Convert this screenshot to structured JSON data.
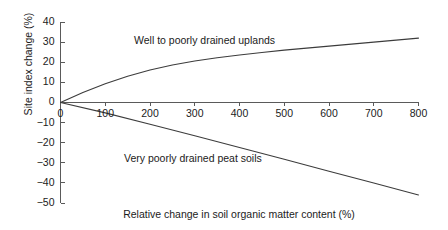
{
  "chart_data": {
    "type": "line",
    "title": "",
    "subtitle": "",
    "xlabel": "Relative change in soil organic matter content (%)",
    "ylabel": "Site index change (%)",
    "xlim": [
      0,
      800
    ],
    "ylim": [
      -50,
      40
    ],
    "xticks": [
      0,
      100,
      200,
      300,
      400,
      500,
      600,
      700,
      800
    ],
    "xticklabels": [
      "0",
      "100",
      "200",
      "300",
      "400",
      "500",
      "600",
      "700",
      "800"
    ],
    "yticks": [
      40,
      30,
      20,
      10,
      0,
      -10,
      -20,
      -30,
      -40,
      -50
    ],
    "yticklabels": [
      "40",
      "30",
      "20",
      "10",
      "0",
      "−10",
      "−20",
      "−30",
      "−40",
      "−50"
    ],
    "grid": false,
    "legend_position": "inline-annotation",
    "axis_color": "#5a5a5a",
    "line_color": "#3c3c3c",
    "background": "#ffffff",
    "series": [
      {
        "name": "Well to poorly drained uplands",
        "annotation": "Well to poorly drained uplands",
        "annotation_x": 330,
        "annotation_y": 30,
        "shape": "concave-increasing",
        "x": [
          0,
          50,
          100,
          150,
          200,
          250,
          300,
          350,
          400,
          450,
          500,
          550,
          600,
          650,
          700,
          750,
          800
        ],
        "y": [
          0,
          5.0,
          9.3,
          13.0,
          16.1,
          18.6,
          20.6,
          22.2,
          23.6,
          24.8,
          26.0,
          27.0,
          28.0,
          29.0,
          30.0,
          31.0,
          32.0
        ]
      },
      {
        "name": "Very poorly drained peat soils",
        "annotation": "Very poorly drained peat soils",
        "annotation_x": 270,
        "annotation_y": -29,
        "shape": "near-linear-decreasing",
        "x": [
          0,
          100,
          200,
          300,
          400,
          500,
          600,
          700,
          800
        ],
        "y": [
          0,
          -5.2,
          -10.8,
          -16.6,
          -22.4,
          -28.2,
          -34.2,
          -40.1,
          -46.0
        ]
      }
    ]
  },
  "figure": {
    "caption": "",
    "axis_tick_length": 4
  }
}
